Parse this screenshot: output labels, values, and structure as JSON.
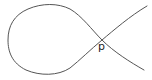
{
  "diagram": {
    "type": "nodal-curve",
    "node": {
      "label": "p",
      "x": 102,
      "y": 40
    },
    "colors": {
      "stroke": "#555555",
      "label": "#222222",
      "background": "#ffffff"
    }
  }
}
